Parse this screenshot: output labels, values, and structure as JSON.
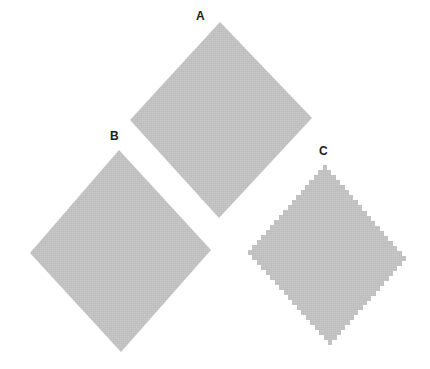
{
  "figure": {
    "background_color": "#ffffff",
    "width": 430,
    "height": 369,
    "fill_color": "#bdbdbd",
    "edge_color": "#bdbdbd",
    "label_color": "#1c1c1c"
  },
  "shapes": [
    {
      "id": "A",
      "label": "A",
      "name": "diamond-a",
      "edge_style": "smooth",
      "description": "Large diamond, smooth anti-aliased edges",
      "center": {
        "x": 221,
        "y": 120
      },
      "radius_x": 91,
      "radius_y": 98,
      "top_vertex": {
        "x": 220,
        "y": 22
      },
      "right_vertex": {
        "x": 312,
        "y": 118
      },
      "bottom_vertex": {
        "x": 219,
        "y": 218
      },
      "left_vertex": {
        "x": 130,
        "y": 120
      },
      "label_pos": {
        "x": 196,
        "y": 10
      },
      "fill": "#bdbdbd"
    },
    {
      "id": "B",
      "label": "B",
      "name": "diamond-b",
      "edge_style": "smooth",
      "description": "Large diamond, smooth anti-aliased edges",
      "center": {
        "x": 120,
        "y": 251
      },
      "radius_x": 90,
      "radius_y": 101,
      "top_vertex": {
        "x": 119,
        "y": 150
      },
      "right_vertex": {
        "x": 211,
        "y": 250
      },
      "bottom_vertex": {
        "x": 121,
        "y": 352
      },
      "left_vertex": {
        "x": 30,
        "y": 253
      },
      "label_pos": {
        "x": 110,
        "y": 130
      },
      "fill": "#bdbdbd"
    },
    {
      "id": "C",
      "label": "C",
      "name": "diamond-c",
      "edge_style": "aliased",
      "description": "Smaller diamond with visible jagged stair-step (aliased) edges",
      "center": {
        "x": 327,
        "y": 255
      },
      "radius_x": 79,
      "radius_y": 90,
      "top_vertex": {
        "x": 327,
        "y": 165
      },
      "right_vertex": {
        "x": 406,
        "y": 256
      },
      "bottom_vertex": {
        "x": 328,
        "y": 345
      },
      "left_vertex": {
        "x": 248,
        "y": 255
      },
      "label_pos": {
        "x": 319,
        "y": 145
      },
      "step_size": 5,
      "fill": "#bdbdbd"
    }
  ]
}
